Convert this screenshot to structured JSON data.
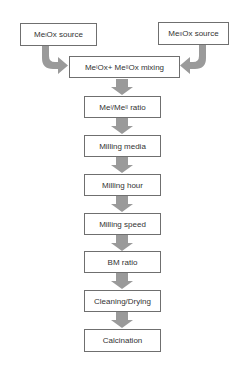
{
  "diagram": {
    "type": "flowchart",
    "sources": [
      {
        "id": "src1",
        "prefix": "Me",
        "sup": "I",
        "suffix": "Ox source"
      },
      {
        "id": "src2",
        "prefix": "Me",
        "sup": "II",
        "suffix": "Ox source"
      }
    ],
    "mixing": {
      "p1": "Me",
      "s1": "I",
      "m1": "Ox+ Me",
      "s2": "II",
      "m2": "Ox mixing"
    },
    "ratio": {
      "p1": "Me",
      "s1": "I",
      "m1": "/Me",
      "s2": "II",
      "m2": " ratio"
    },
    "steps": [
      "Milling media",
      "Milling hour",
      "Milling speed",
      "BM ratio",
      "Cleaning/Drying",
      "Calcination"
    ],
    "colors": {
      "arrow": "#9a9a9a",
      "border": "#6f6f6f",
      "text": "#333333"
    }
  }
}
